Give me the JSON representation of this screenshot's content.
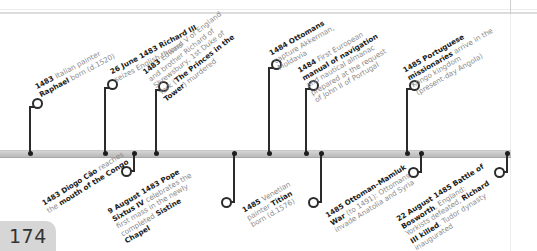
{
  "page": {
    "number": "174"
  },
  "timeline": {
    "above": [
      {
        "id": "raphael",
        "parts": [
          [
            "b",
            "1483 "
          ],
          [
            "n",
            "Italian painter"
          ],
          [
            "br"
          ],
          [
            "b",
            "Raphael"
          ],
          [
            "n",
            " born (d.1520)"
          ]
        ]
      },
      {
        "id": "richard3",
        "parts": [
          [
            "b",
            "26 June 1483 Richard III"
          ],
          [
            "br"
          ],
          [
            "n",
            "seizes English throne"
          ]
        ]
      },
      {
        "id": "princes",
        "parts": [
          [
            "b",
            "1483 "
          ],
          [
            "n",
            "Edward V of England"
          ],
          [
            "br"
          ],
          [
            "n",
            "and brother Richard of"
          ],
          [
            "br"
          ],
          [
            "n",
            "Shrewsbury, 1st Duke of"
          ],
          [
            "br"
          ],
          [
            "n",
            "York ("
          ],
          [
            "b",
            "The Princes in the"
          ],
          [
            "br"
          ],
          [
            "b",
            "Tower"
          ],
          [
            "n",
            ") murdered"
          ]
        ]
      },
      {
        "id": "akkerman",
        "parts": [
          [
            "b",
            "1484 Ottomans"
          ],
          [
            "br"
          ],
          [
            "n",
            "capture Akkerman,"
          ],
          [
            "br"
          ],
          [
            "n",
            "Moldavia"
          ]
        ]
      },
      {
        "id": "navigation",
        "parts": [
          [
            "b",
            "1484 "
          ],
          [
            "n",
            "First European"
          ],
          [
            "br"
          ],
          [
            "b",
            "manual of navigation"
          ],
          [
            "br"
          ],
          [
            "n",
            "and nautical almanac"
          ],
          [
            "br"
          ],
          [
            "n",
            "prepared at the request"
          ],
          [
            "br"
          ],
          [
            "n",
            "of John II of Portugal"
          ]
        ]
      },
      {
        "id": "missionaries",
        "parts": [
          [
            "b",
            "1485 Portuguese"
          ],
          [
            "br"
          ],
          [
            "b",
            "missionaries"
          ],
          [
            "n",
            " arrive in the"
          ],
          [
            "br"
          ],
          [
            "n",
            "Kongo kingdom"
          ],
          [
            "br"
          ],
          [
            "n",
            "(present-day Angola)"
          ]
        ]
      }
    ],
    "below": [
      {
        "id": "congo",
        "parts": [
          [
            "b",
            "1483 Diogo Cão "
          ],
          [
            "n",
            "reaches"
          ],
          [
            "br"
          ],
          [
            "n",
            "the "
          ],
          [
            "b",
            "mouth of the Congo"
          ]
        ]
      },
      {
        "id": "sistine",
        "parts": [
          [
            "b",
            "9 August 1483 Pope"
          ],
          [
            "br"
          ],
          [
            "b",
            "Sixtus IV "
          ],
          [
            "n",
            "celebrates the"
          ],
          [
            "br"
          ],
          [
            "n",
            "first mass in the newly"
          ],
          [
            "br"
          ],
          [
            "n",
            "completed "
          ],
          [
            "b",
            "Sistine"
          ],
          [
            "br"
          ],
          [
            "b",
            "Chapel"
          ]
        ]
      },
      {
        "id": "titian",
        "parts": [
          [
            "b",
            "1485 "
          ],
          [
            "n",
            "Venetian"
          ],
          [
            "br"
          ],
          [
            "n",
            "painter "
          ],
          [
            "b",
            "Titian"
          ],
          [
            "br"
          ],
          [
            "n",
            "born (d.1576)"
          ]
        ]
      },
      {
        "id": "mamluk",
        "parts": [
          [
            "b",
            "1485 Ottoman–Mamluk"
          ],
          [
            "br"
          ],
          [
            "b",
            "War "
          ],
          [
            "n",
            "(to 1491): Ottomans"
          ],
          [
            "br"
          ],
          [
            "n",
            "invade Anatolia and Syria"
          ]
        ]
      },
      {
        "id": "bosworth",
        "parts": [
          [
            "b",
            "22 August 1485 Battle of"
          ],
          [
            "br"
          ],
          [
            "b",
            "Bosworth"
          ],
          [
            "n",
            ", England:"
          ],
          [
            "br"
          ],
          [
            "n",
            "Yorkists defeated, "
          ],
          [
            "b",
            "Richard"
          ],
          [
            "br"
          ],
          [
            "b",
            "III killed"
          ],
          [
            "n",
            ". Tudor dynasty"
          ],
          [
            "br"
          ],
          [
            "n",
            "inaugurated"
          ]
        ]
      }
    ]
  },
  "colors": {
    "bar": "#c4c4c4",
    "stem": "#2b2b2b",
    "muted_text": "#8a8a8a",
    "bold_text": "#1b1b1b",
    "page_tab": "#d6d6d6"
  }
}
